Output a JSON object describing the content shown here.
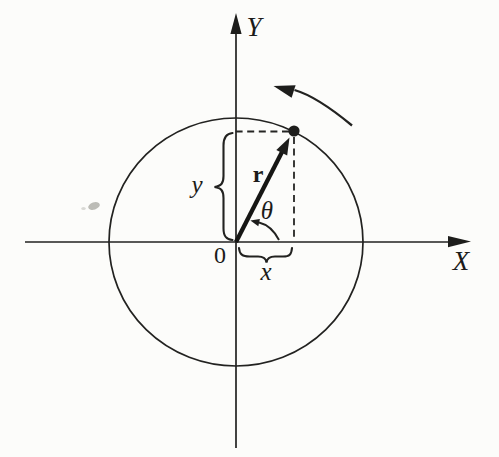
{
  "figure": {
    "background_color": "#fcfcfa",
    "ink_color": "#1d1d1b",
    "labels": {
      "y_axis": "Y",
      "x_axis": "X",
      "origin": "0",
      "radius_vector": "r",
      "angle": "θ",
      "y_component": "y",
      "x_component": "x"
    }
  }
}
